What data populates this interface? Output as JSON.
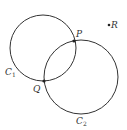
{
  "diagram": {
    "stroke_color": "#333333",
    "background": "#ffffff",
    "circles": [
      {
        "name": "C1",
        "label": "C",
        "subscript": "1",
        "cx": 43,
        "cy": 48,
        "r": 33,
        "label_x": 5,
        "label_y": 75
      },
      {
        "name": "C2",
        "label": "C",
        "subscript": "2",
        "cx": 81,
        "cy": 77,
        "r": 37,
        "label_x": 76,
        "label_y": 124
      }
    ],
    "points": [
      {
        "name": "P",
        "label": "P",
        "x": 74,
        "y": 41,
        "label_x": 76,
        "label_y": 37
      },
      {
        "name": "Q",
        "label": "Q",
        "x": 44,
        "y": 81,
        "label_x": 33,
        "label_y": 92
      },
      {
        "name": "R",
        "label": "R",
        "x": 109,
        "y": 25,
        "label_x": 111,
        "label_y": 28
      }
    ]
  }
}
